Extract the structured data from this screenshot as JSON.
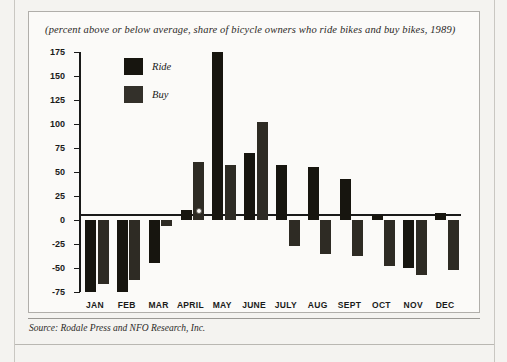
{
  "subtitle": "(percent above or below average, share of bicycle owners who ride bikes and buy bikes, 1989)",
  "source_note": "Source: Rodale Press and NFO Research, Inc.",
  "legend": {
    "position": "inside-top-left",
    "entries": [
      {
        "label": "Ride",
        "color": "#17150f"
      },
      {
        "label": "Buy",
        "color": "#33302a"
      }
    ]
  },
  "colors": {
    "page_background": "#f4f3f0",
    "figure_background": "#fbfaf8",
    "figure_border": "#b0aeaa",
    "axis": "#1a1a1a",
    "ride_series": "#17150f",
    "buy_series": "#2e2b24"
  },
  "chart_data": {
    "type": "bar",
    "title": "",
    "subtitle": "(percent above or below average, share of bicycle owners who ride bikes and buy bikes, 1989)",
    "xlabel": "",
    "ylabel": "",
    "ylim": [
      -75,
      175
    ],
    "yticks": [
      175,
      150,
      125,
      100,
      75,
      50,
      25,
      0,
      -25,
      -50,
      -75
    ],
    "ytick_labels": [
      "175",
      "150",
      "125",
      "100",
      "75",
      "50",
      "25",
      "0",
      "-25",
      "-50",
      "-75"
    ],
    "grid": false,
    "legend": [
      "Ride",
      "Buy"
    ],
    "legend_position": "upper left inside plot",
    "categories": [
      "JAN",
      "FEB",
      "MAR",
      "APRIL",
      "MAY",
      "JUNE",
      "JULY",
      "AUG",
      "SEPT",
      "OCT",
      "NOV",
      "DEC"
    ],
    "series": [
      {
        "name": "Ride",
        "color": "#17150f",
        "values": [
          -75,
          -75,
          -45,
          10,
          175,
          70,
          57,
          55,
          43,
          5,
          -50,
          7
        ]
      },
      {
        "name": "Buy",
        "color": "#2e2b24",
        "values": [
          -67,
          -62,
          -6,
          60,
          57,
          102,
          -27,
          -35,
          -38,
          -48,
          -57,
          -52
        ]
      }
    ]
  }
}
